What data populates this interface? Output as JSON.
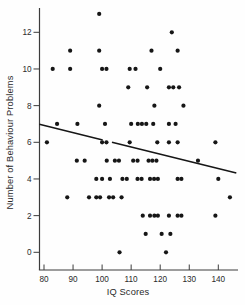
{
  "chart_data": {
    "type": "scatter",
    "title": "",
    "xlabel": "IQ Scores",
    "ylabel": "Number of Behaviour Problems",
    "xlim": [
      78.4,
      146.5
    ],
    "ylim": [
      -1,
      13.5
    ],
    "x_ticks": [
      80,
      90,
      100,
      110,
      120,
      130,
      140
    ],
    "y_ticks": [
      0,
      2,
      4,
      6,
      8,
      10,
      12
    ],
    "grid": false,
    "legend": false,
    "colors": {
      "points": "#161616",
      "regression_line": "#161616",
      "axis": "#3c3c3c"
    },
    "points": [
      [
        99,
        13
      ],
      [
        124,
        12
      ],
      [
        89,
        11
      ],
      [
        99,
        11
      ],
      [
        117,
        11
      ],
      [
        126,
        11
      ],
      [
        83,
        10
      ],
      [
        89,
        10
      ],
      [
        100,
        10
      ],
      [
        101.5,
        10
      ],
      [
        109.5,
        10
      ],
      [
        111.5,
        10
      ],
      [
        120,
        10
      ],
      [
        109,
        9
      ],
      [
        115.5,
        9
      ],
      [
        123,
        9
      ],
      [
        124.5,
        9
      ],
      [
        126.5,
        9
      ],
      [
        99,
        8
      ],
      [
        118,
        8
      ],
      [
        128,
        8
      ],
      [
        84.5,
        7
      ],
      [
        91.5,
        7
      ],
      [
        101,
        7
      ],
      [
        110,
        7
      ],
      [
        112.3,
        7
      ],
      [
        113.7,
        7
      ],
      [
        115.2,
        7
      ],
      [
        117.6,
        7
      ],
      [
        123,
        7
      ],
      [
        125.3,
        7
      ],
      [
        81,
        6
      ],
      [
        100,
        6
      ],
      [
        101.5,
        6
      ],
      [
        109.5,
        6
      ],
      [
        119,
        6
      ],
      [
        123,
        6
      ],
      [
        126,
        6
      ],
      [
        139,
        6
      ],
      [
        91.3,
        5
      ],
      [
        94,
        5
      ],
      [
        101.6,
        5
      ],
      [
        104.4,
        5
      ],
      [
        105.8,
        5
      ],
      [
        110.7,
        5
      ],
      [
        112.2,
        5
      ],
      [
        116,
        5
      ],
      [
        117.3,
        5
      ],
      [
        118.7,
        5
      ],
      [
        133,
        5
      ],
      [
        98,
        4
      ],
      [
        100,
        4
      ],
      [
        102.7,
        4
      ],
      [
        107,
        4
      ],
      [
        108.5,
        4
      ],
      [
        112.2,
        4
      ],
      [
        113.6,
        4
      ],
      [
        116.5,
        4
      ],
      [
        117.9,
        4
      ],
      [
        119.2,
        4
      ],
      [
        126,
        4
      ],
      [
        127.3,
        4
      ],
      [
        140,
        4
      ],
      [
        88,
        3
      ],
      [
        95.5,
        3
      ],
      [
        98,
        3
      ],
      [
        99.3,
        3
      ],
      [
        102.4,
        3
      ],
      [
        103.8,
        3
      ],
      [
        106.7,
        3
      ],
      [
        144,
        3
      ],
      [
        114,
        2
      ],
      [
        116.5,
        2
      ],
      [
        118,
        2
      ],
      [
        119.2,
        2
      ],
      [
        123,
        2
      ],
      [
        126,
        2
      ],
      [
        127.3,
        2
      ],
      [
        139,
        2
      ],
      [
        115,
        1
      ],
      [
        120.5,
        1
      ],
      [
        123.5,
        1
      ],
      [
        106,
        0
      ],
      [
        122,
        0
      ]
    ],
    "regression_line_segments": [
      [
        78.4,
        6.98,
        100.2,
        6.13
      ],
      [
        103.4,
        6.0,
        146.2,
        4.33
      ]
    ]
  }
}
